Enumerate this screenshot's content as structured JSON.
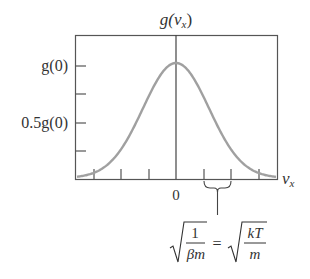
{
  "chart_data": {
    "type": "line",
    "title_main": "g(v",
    "title_sub": "x",
    "title_close": ")",
    "xlabel_main": "v",
    "xlabel_sub": "x",
    "ylabel": "",
    "y_tick_labels": [
      "g(0)",
      "0.5g(0)"
    ],
    "x_tick_labels": [
      "0"
    ],
    "x_ticks_count_each_side": 3,
    "y_ticks_count": 4,
    "series": [
      {
        "name": "g(v_x)",
        "function": "gaussian",
        "mean": 0,
        "sigma_in_tick_units": 1.2,
        "peak": 1.0,
        "color": "#a0a0a0"
      }
    ],
    "annotation": {
      "brace_span_ticks": [
        1,
        2
      ],
      "formula": "√(1/(βm)) = √(kT/m)",
      "lhs_num": "1",
      "lhs_den": "βm",
      "equals": "=",
      "rhs_num": "kT",
      "rhs_den": "m"
    },
    "grid": false,
    "frame": true
  },
  "style": {
    "axis_color": "#555555",
    "curve_color": "#a0a0a0"
  }
}
